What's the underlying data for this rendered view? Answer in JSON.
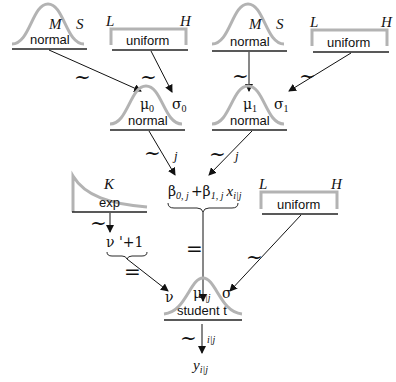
{
  "diagram": {
    "type": "hierarchical-bayesian-model",
    "top_row": [
      {
        "id": "prior-mu0",
        "dist": "normal",
        "params": [
          "M",
          "S"
        ]
      },
      {
        "id": "prior-sigma0",
        "dist": "uniform",
        "params": [
          "L",
          "H"
        ]
      },
      {
        "id": "prior-mu1",
        "dist": "normal",
        "params": [
          "M",
          "S"
        ]
      },
      {
        "id": "prior-sigma1",
        "dist": "uniform",
        "params": [
          "L",
          "H"
        ]
      }
    ],
    "middle_row": [
      {
        "id": "beta0-dist",
        "dist": "normal",
        "params": [
          "μ",
          "σ"
        ],
        "param_subs": [
          "0",
          "0"
        ]
      },
      {
        "id": "beta1-dist",
        "dist": "normal",
        "params": [
          "μ",
          "σ"
        ],
        "param_subs": [
          "1",
          "1"
        ]
      }
    ],
    "exp_node": {
      "dist": "exp",
      "param": "K"
    },
    "uniform_sigma": {
      "dist": "uniform",
      "params": [
        "L",
        "H"
      ]
    },
    "linear_predictor": {
      "beta": "β",
      "sub0": "0, j",
      "plus": "+",
      "sub1": "1, j",
      "x": "x",
      "xsub": "i|j"
    },
    "nu_expr": {
      "nu": "ν",
      "rest": " '+1"
    },
    "likelihood": {
      "dist": "student t",
      "params": [
        "ν",
        "μ",
        "σ"
      ],
      "mu_sub": "i|j"
    },
    "observed": {
      "y": "y",
      "sub": "i|j"
    },
    "symbols": {
      "tilde": "~",
      "equals": "=",
      "j": "j",
      "ij": "i|j"
    }
  }
}
